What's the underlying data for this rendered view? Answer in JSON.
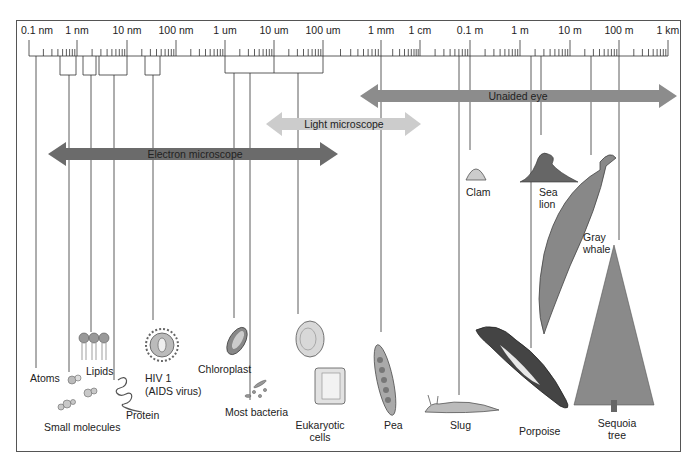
{
  "figure": {
    "scale": {
      "labels": [
        "0.1 nm",
        "1 nm",
        "10 nm",
        "100 nm",
        "1 um",
        "10 um",
        "100 um",
        "1 mm",
        "1 cm",
        "0.1 m",
        "1 m",
        "10 m",
        "100 m",
        "1 km"
      ],
      "positions_x": [
        37,
        77,
        127,
        176,
        225,
        274,
        323,
        381,
        420,
        470,
        520,
        570,
        619,
        668
      ]
    },
    "ranges": [
      {
        "name": "Unaided eye",
        "color": "#8c8c8c",
        "x1": 360,
        "x2": 677,
        "y": 96
      },
      {
        "name": "Light microscope",
        "color": "#c9c9c9",
        "x1": 266,
        "x2": 421,
        "y": 124
      },
      {
        "name": "Electron microscope",
        "color": "#6e6e6e",
        "x1": 48,
        "x2": 338,
        "y": 154
      }
    ],
    "objects": [
      {
        "label": "Atoms"
      },
      {
        "label": "Small molecules"
      },
      {
        "label": "Lipids"
      },
      {
        "label": "Protein"
      },
      {
        "label": "HIV 1",
        "label2": "(AIDS virus)"
      },
      {
        "label": "Chloroplast"
      },
      {
        "label": "Most bacteria"
      },
      {
        "label": "Eukaryotic",
        "label2": "cells"
      },
      {
        "label": "Pea"
      },
      {
        "label": "Slug"
      },
      {
        "label": "Clam"
      },
      {
        "label": "Sea",
        "label2": "lion"
      },
      {
        "label": "Gray",
        "label2": "whale"
      },
      {
        "label": "Porpoise"
      },
      {
        "label": "Sequoia",
        "label2": "tree"
      }
    ]
  }
}
